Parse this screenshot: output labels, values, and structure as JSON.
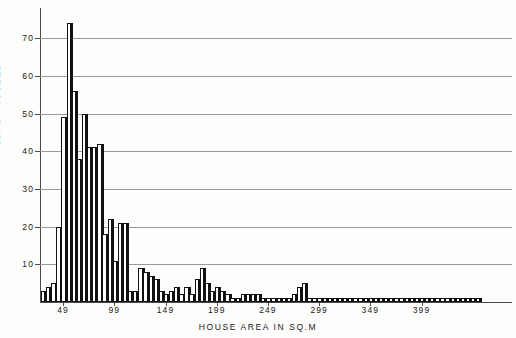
{
  "chart_data": {
    "type": "bar",
    "title": "",
    "xlabel": "HOUSE AREA IN SQ.M",
    "ylabel": "NO. OF HOUSES",
    "ylim": [
      0,
      78
    ],
    "yticks": [
      10,
      20,
      30,
      40,
      50,
      60,
      70
    ],
    "ytick_labels": [
      "10",
      "20",
      "30",
      "40",
      "50",
      "60",
      "70"
    ],
    "xtick_labels": [
      "49",
      "99",
      "149",
      "199",
      "249",
      "299",
      "349",
      "399"
    ],
    "xtick_values": [
      49,
      99,
      149,
      199,
      249,
      299,
      349,
      399
    ],
    "grid": "horizontal",
    "legend": "none",
    "bar_style": "white-face-black-shadow",
    "x_start": 29,
    "x_step": 5,
    "categories": [
      "29",
      "34",
      "39",
      "44",
      "49",
      "54",
      "59",
      "64",
      "69",
      "74",
      "79",
      "84",
      "89",
      "94",
      "99",
      "104",
      "109",
      "114",
      "119",
      "124",
      "129",
      "134",
      "139",
      "144",
      "149",
      "154",
      "159",
      "164",
      "169",
      "174",
      "179",
      "184",
      "189",
      "194",
      "199",
      "204",
      "209",
      "214",
      "219",
      "224",
      "229",
      "234",
      "239",
      "244",
      "249",
      "254",
      "259",
      "264",
      "269",
      "274",
      "279",
      "284",
      "289",
      "294",
      "299",
      "304",
      "309",
      "314",
      "319",
      "324",
      "329",
      "334",
      "339",
      "344",
      "349",
      "354",
      "359",
      "364",
      "369",
      "374",
      "379",
      "384",
      "389",
      "394",
      "399",
      "404",
      "409",
      "414",
      "419",
      "424",
      "429",
      "434",
      "439",
      "444",
      "449",
      "454"
    ],
    "values": [
      3,
      4,
      5,
      20,
      49,
      74,
      56,
      38,
      50,
      41,
      41,
      42,
      18,
      22,
      11,
      21,
      21,
      3,
      3,
      9,
      8,
      7,
      6,
      3,
      2,
      3,
      4,
      2,
      4,
      2,
      6,
      9,
      5,
      3,
      4,
      3,
      2,
      1,
      1,
      2,
      2,
      2,
      2,
      1,
      1,
      1,
      1,
      1,
      1,
      2,
      4,
      5,
      1,
      1,
      1,
      1,
      1,
      1,
      1,
      1,
      1,
      1,
      1,
      1,
      1,
      1,
      1,
      1,
      1,
      1,
      1,
      1,
      1,
      1,
      1,
      1,
      1,
      1,
      1,
      1,
      1,
      1,
      1,
      1,
      1,
      1
    ],
    "peak_value": 74,
    "peak_category": "54",
    "n_bars": 86
  },
  "axes": {
    "y_axis_name": "y-axis",
    "x_axis_name": "x-axis"
  }
}
